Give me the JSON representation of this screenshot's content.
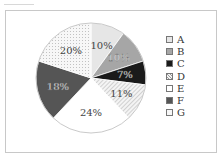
{
  "chart_data": {
    "type": "pie",
    "title": "",
    "categories": [
      "A",
      "B",
      "C",
      "D",
      "E",
      "F",
      "G"
    ],
    "values": [
      10,
      10,
      7,
      11,
      24,
      18,
      20
    ],
    "labels": [
      "10%",
      "10%",
      "7%",
      "11%",
      "24%",
      "18%",
      "20%"
    ],
    "fills": [
      "light-gray",
      "medium-gray",
      "black",
      "diagonal-hatch",
      "white",
      "dark-gray",
      "dotted"
    ],
    "colors": [
      "#e6e6e6",
      "#a6a6a6",
      "#1a1a1a",
      "#f2f2f2",
      "#ffffff",
      "#555555",
      "#f5f5f5"
    ],
    "start_angle": "12 o'clock",
    "direction": "clockwise",
    "legend_position": "right"
  },
  "legend": {
    "items": [
      {
        "label": "A"
      },
      {
        "label": "B"
      },
      {
        "label": "C"
      },
      {
        "label": "D"
      },
      {
        "label": "E"
      },
      {
        "label": "F"
      },
      {
        "label": "G"
      }
    ]
  }
}
